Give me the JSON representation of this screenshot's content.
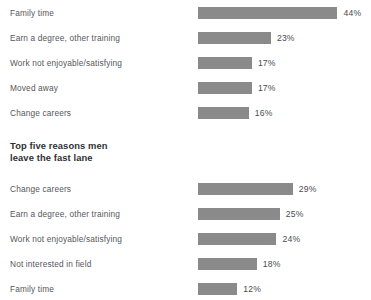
{
  "section_heading": "Top five reasons men\nleave the fast lane",
  "style": {
    "bar_color": "#8a8a8a",
    "label_color": "#55585c",
    "value_color": "#4a4d50",
    "heading_color": "#2e3134",
    "background": "#ffffff"
  },
  "chart_data": [
    {
      "type": "bar",
      "orientation": "horizontal",
      "id": "top-chart",
      "title": "",
      "xlabel": "",
      "ylabel": "",
      "xlim": [
        0,
        44
      ],
      "grid": false,
      "legend": "none",
      "px_per_unit": 3.17,
      "categories": [
        "Family time",
        "Earn a degree, other training",
        "Work not enjoyable/satisfying",
        "Moved away",
        "Change careers"
      ],
      "values": [
        44,
        23,
        17,
        17,
        16
      ],
      "value_labels": [
        "44%",
        "23%",
        "17%",
        "17%",
        "16%"
      ]
    },
    {
      "type": "bar",
      "orientation": "horizontal",
      "id": "bottom-chart",
      "title": "Top five reasons men leave the fast lane",
      "xlabel": "",
      "ylabel": "",
      "xlim": [
        0,
        29
      ],
      "grid": false,
      "legend": "none",
      "px_per_unit": 3.27,
      "categories": [
        "Change careers",
        "Earn a degree, other training",
        "Work not enjoyable/satisfying",
        "Not interested in field",
        "Family time"
      ],
      "values": [
        29,
        25,
        24,
        18,
        12
      ],
      "value_labels": [
        "29%",
        "25%",
        "24%",
        "18%",
        "12%"
      ]
    }
  ]
}
